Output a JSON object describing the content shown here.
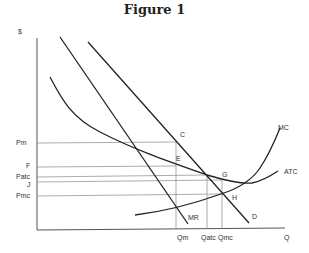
{
  "title": "Figure 1",
  "axes": {
    "y_label": "$",
    "x_label": "Q"
  },
  "price_labels": {
    "pm": "Pm",
    "f": "F",
    "patc": "Patc",
    "j": "J",
    "pmc": "Pmc"
  },
  "quantity_labels": {
    "qm": "Qm",
    "qatc": "Qatc",
    "qmc": "Qmc"
  },
  "curve_labels": {
    "mc": "MC",
    "atc": "ATC",
    "d": "D",
    "mr": "MR"
  },
  "point_labels": {
    "c": "C",
    "e": "E",
    "g": "G",
    "h": "H"
  },
  "colors": {
    "curve": "#222222",
    "guide": "#777777",
    "axis": "#555555"
  }
}
